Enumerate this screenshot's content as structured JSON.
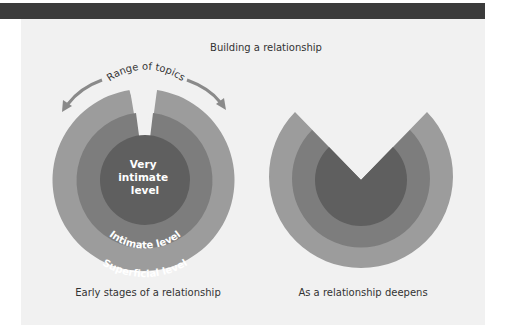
{
  "title": "Building a relationship",
  "arc_label": "Range of topics",
  "left_diagram": {
    "caption": "Early stages of a relationship",
    "inner_label": [
      "Very",
      "intimate",
      "level"
    ],
    "middle_label": "Intimate level",
    "outer_label": "Superficial level"
  },
  "right_diagram": {
    "caption": "As a relationship deepens"
  },
  "colors": {
    "band": "#3b3b3b",
    "panel": "#f1f1f1",
    "outer_ring": "#9c9c9c",
    "middle_ring": "#7d7d7d",
    "inner_core": "#5f5f5f",
    "arrow": "#8a8a8a"
  }
}
